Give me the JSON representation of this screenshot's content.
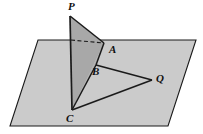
{
  "figure": {
    "labels": {
      "P": "P",
      "A": "A",
      "B": "B",
      "Q": "Q",
      "C": "C"
    }
  },
  "colors": {
    "background": "#ffffff",
    "plane_fill": "#cbcbcb",
    "triangle_pac_fill": "#a8a8a8",
    "triangle_cab_fill": "#b0b0b0",
    "stroke": "#1a1a1a",
    "label_text": "#101010"
  },
  "geometry": {
    "plane_polygon": [
      [
        38,
        40
      ],
      [
        196,
        40
      ],
      [
        168,
        126
      ],
      [
        10,
        126
      ]
    ],
    "point_P": [
      70,
      16
    ],
    "point_A": [
      104,
      43
    ],
    "point_B": [
      96,
      65
    ],
    "point_Q": [
      152,
      80
    ],
    "point_C": [
      72,
      110
    ],
    "segment_PC": [
      [
        70,
        16
      ],
      [
        72,
        110
      ]
    ],
    "segment_PA": [
      [
        70,
        16
      ],
      [
        104,
        43
      ]
    ],
    "segment_AB": [
      [
        104,
        43
      ],
      [
        96,
        65
      ]
    ],
    "segment_BC": [
      [
        96,
        65
      ],
      [
        72,
        110
      ]
    ],
    "segment_BQ": [
      [
        96,
        65
      ],
      [
        152,
        80
      ]
    ],
    "segment_CQ": [
      [
        72,
        110
      ],
      [
        152,
        80
      ]
    ],
    "dashed_segment": [
      [
        71,
        40
      ],
      [
        104,
        43
      ]
    ],
    "triangle_PAC": [
      [
        70,
        16
      ],
      [
        104,
        43
      ],
      [
        72,
        110
      ]
    ],
    "triangle_CAB": [
      [
        72,
        110
      ],
      [
        104,
        43
      ],
      [
        96,
        65
      ]
    ],
    "triangle_BQC": [
      [
        96,
        65
      ],
      [
        152,
        80
      ],
      [
        72,
        110
      ]
    ]
  },
  "label_positions": {
    "P": [
      68,
      1
    ],
    "A": [
      109,
      44
    ],
    "B": [
      92,
      66
    ],
    "Q": [
      156,
      73
    ],
    "C": [
      66,
      113
    ]
  }
}
